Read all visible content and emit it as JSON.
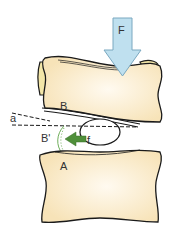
{
  "diagram": {
    "labels": {
      "force": "F",
      "upper_vertebra": "B",
      "lower_vertebra": "A",
      "displaced": "B'",
      "angle": "a",
      "disc_force": "f"
    },
    "colors": {
      "bone_fill": "#f7e3b8",
      "bone_center": "#fffaf0",
      "bone_back": "#f3e6a8",
      "outline": "#1a1a1a",
      "force_arrow": "#bfe0ef",
      "force_arrow_stroke": "#7aa8c0",
      "small_arrow": "#4f8f3a",
      "arc": "#6fae5a"
    }
  }
}
